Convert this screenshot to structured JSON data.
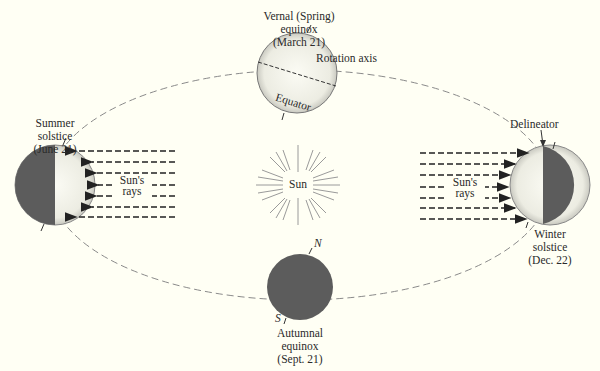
{
  "colors": {
    "background": "#fffff4",
    "earth_dark": "#5c5c5c",
    "earth_light": "#f4f4ec",
    "orbit": "#888888",
    "rays": "#222222",
    "text": "#2a2a2a",
    "sun_rays": "#9a9a9a"
  },
  "labels": {
    "vernal": [
      "Vernal (Spring)",
      "equinox",
      "(March 21)"
    ],
    "rotation_axis": "Rotation axis",
    "equator": "Equator",
    "summer": [
      "Summer",
      "solstice",
      "(June 21)"
    ],
    "winter": [
      "Winter",
      "solstice",
      "(Dec. 22)"
    ],
    "delineator": "Delineator",
    "sun": "Sun",
    "suns_rays_left": [
      "Sun's",
      "rays"
    ],
    "suns_rays_right": [
      "Sun's",
      "rays"
    ],
    "north": "N",
    "south": "S",
    "autumnal": [
      "Autumnal",
      "equinox",
      "(Sept. 21)"
    ]
  }
}
